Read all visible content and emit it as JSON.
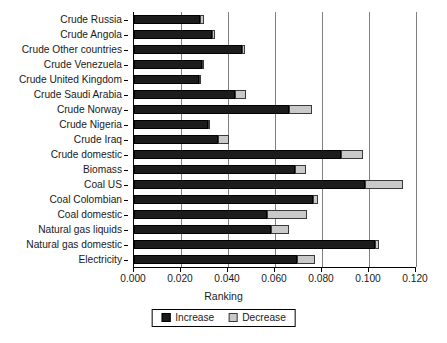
{
  "chart_data": {
    "type": "bar",
    "orientation": "horizontal",
    "stacked": true,
    "title": "",
    "xlabel": "Ranking",
    "ylabel": "",
    "xlim": [
      0.0,
      0.12
    ],
    "xticks": [
      0.0,
      0.02,
      0.04,
      0.06,
      0.08,
      0.1,
      0.12
    ],
    "xticklabels": [
      "0.000",
      "0.020",
      "0.040",
      "0.060",
      "0.080",
      "0.100",
      "0.120"
    ],
    "grid": "vertical",
    "legend_position": "bottom-center",
    "categories": [
      "Crude Russia",
      "Crude Angola",
      "Crude Other countries",
      "Crude Venezuela",
      "Crude United Kingdom",
      "Crude Saudi Arabia",
      "Crude Norway",
      "Crude Nigeria",
      "Crude Iraq",
      "Crude domestic",
      "Biomass",
      "Coal US",
      "Coal Colombian",
      "Coal domestic",
      "Natural gas liquids",
      "Natural gas domestic",
      "Electricity"
    ],
    "series": [
      {
        "name": "Increase",
        "color": "#1c1c1c",
        "values": [
          0.028,
          0.0332,
          0.0458,
          0.029,
          0.0275,
          0.043,
          0.066,
          0.0317,
          0.0358,
          0.0881,
          0.0685,
          0.0985,
          0.076,
          0.0565,
          0.0583,
          0.1025,
          0.0695
        ]
      },
      {
        "name": "Decrease",
        "color": "#c9c9c9",
        "values": [
          0.002,
          0.0012,
          0.0015,
          0.0005,
          0.0012,
          0.0048,
          0.0097,
          0.0005,
          0.0045,
          0.0093,
          0.0048,
          0.016,
          0.0025,
          0.017,
          0.0075,
          0.0018,
          0.0075
        ]
      }
    ],
    "totals": [
      0.03,
      0.0344,
      0.0473,
      0.0295,
      0.0287,
      0.0478,
      0.0757,
      0.0322,
      0.0403,
      0.0974,
      0.0733,
      0.1145,
      0.0785,
      0.0735,
      0.0658,
      0.1043,
      0.077
    ]
  },
  "legend": {
    "entries": [
      {
        "label": "Increase",
        "swatch": "increase-swatch"
      },
      {
        "label": "Decrease",
        "swatch": "decrease-swatch"
      }
    ]
  }
}
